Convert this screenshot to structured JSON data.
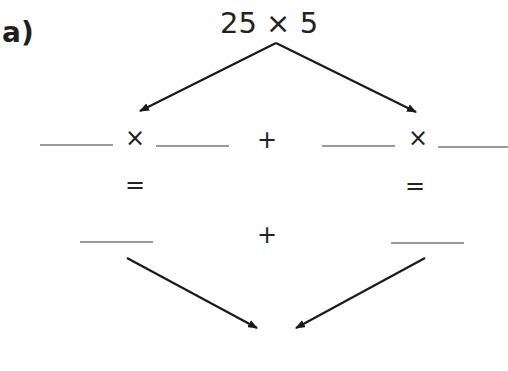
{
  "question": {
    "label": "a)",
    "expression": "25 × 5"
  },
  "row1": {
    "left": {
      "times": "×"
    },
    "plus": "+",
    "right": {
      "times": "×"
    }
  },
  "row2": {
    "left_equals": "=",
    "right_equals": "="
  },
  "row3": {
    "plus": "+"
  },
  "colors": {
    "ink": "#222222",
    "blank_line": "#9a9a9a"
  }
}
